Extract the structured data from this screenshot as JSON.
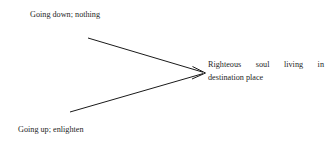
{
  "diagram": {
    "type": "converging-arrow-diagram",
    "background_color": "#ffffff",
    "stroke_color": "#1a1a1a",
    "text_color": "#262626",
    "labels": {
      "top_left": "Going down; nothing",
      "bottom_left": "Going up; enlighten",
      "right_line1": "Righteous soul living in",
      "right_line2": "destination place"
    },
    "arrows": [
      {
        "name": "upper-branch",
        "from_x": 88,
        "from_y": 38,
        "to_x": 204,
        "to_y": 72,
        "has_arrowhead": true
      },
      {
        "name": "lower-branch",
        "from_x": 70,
        "from_y": 112,
        "to_x": 204,
        "to_y": 74,
        "has_arrowhead": true
      }
    ]
  }
}
